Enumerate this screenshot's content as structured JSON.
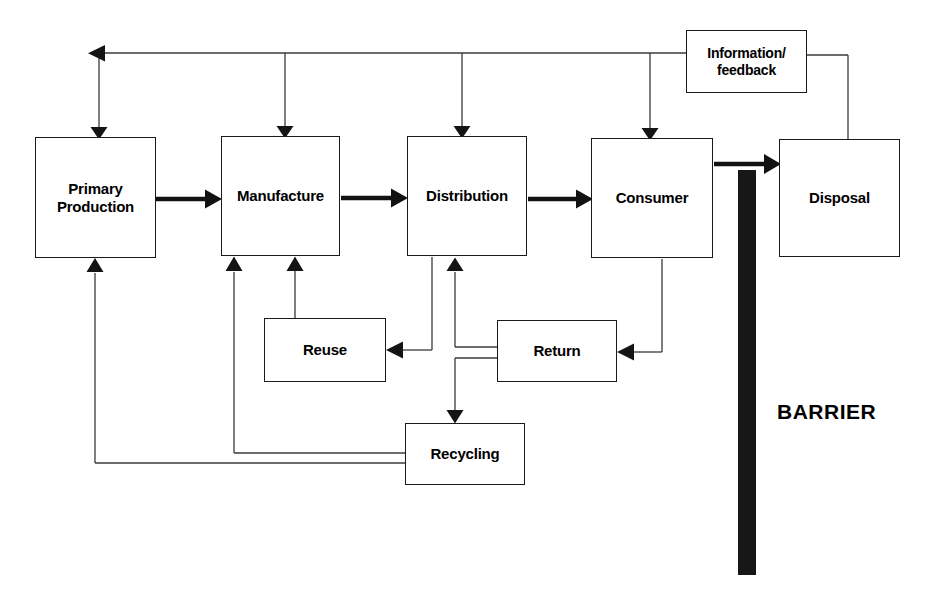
{
  "diagram": {
    "stroke_color": "#1a1a1a",
    "fill_color": "#ffffff",
    "barrier_color": "#171717",
    "nodes": [
      {
        "id": "primary_production",
        "label": "Primary\nProduction",
        "x": 35,
        "y": 137,
        "w": 121,
        "h": 121,
        "font_size": 15
      },
      {
        "id": "manufacture",
        "label": "Manufacture",
        "x": 221,
        "y": 136,
        "w": 119,
        "h": 120,
        "font_size": 15
      },
      {
        "id": "distribution",
        "label": "Distribution",
        "x": 407,
        "y": 136,
        "w": 120,
        "h": 120,
        "font_size": 15
      },
      {
        "id": "consumer",
        "label": "Consumer",
        "x": 591,
        "y": 138,
        "w": 122,
        "h": 120,
        "font_size": 15
      },
      {
        "id": "disposal",
        "label": "Disposal",
        "x": 779,
        "y": 139,
        "w": 121,
        "h": 118,
        "font_size": 15
      },
      {
        "id": "information_feedback",
        "label": "Information/\nfeedback",
        "x": 686,
        "y": 30,
        "w": 121,
        "h": 63,
        "font_size": 14
      },
      {
        "id": "reuse",
        "label": "Reuse",
        "x": 264,
        "y": 318,
        "w": 122,
        "h": 64,
        "font_size": 15
      },
      {
        "id": "return",
        "label": "Return",
        "x": 497,
        "y": 320,
        "w": 120,
        "h": 62,
        "font_size": 15
      },
      {
        "id": "recycling",
        "label": "Recycling",
        "x": 405,
        "y": 423,
        "w": 120,
        "h": 62,
        "font_size": 15
      }
    ],
    "barrier": {
      "label": "BARRIER",
      "bar_x": 738,
      "bar_y": 170,
      "bar_w": 18,
      "bar_h": 405,
      "text_x": 777,
      "text_y": 400,
      "font_size": 21
    },
    "edges": [
      {
        "id": "primary-to-manufacture",
        "from": "primary_production",
        "to": "manufacture",
        "style": "thick"
      },
      {
        "id": "manufacture-to-distribution",
        "from": "manufacture",
        "to": "distribution",
        "style": "thick"
      },
      {
        "id": "distribution-to-consumer",
        "from": "distribution",
        "to": "consumer",
        "style": "thick"
      },
      {
        "id": "consumer-to-disposal",
        "from": "consumer",
        "to": "disposal",
        "style": "thick"
      },
      {
        "id": "feedback-bus",
        "from": "information_feedback",
        "to": "primary_production",
        "style": "thin"
      },
      {
        "id": "feedback-to-manufacture",
        "from": "information_feedback",
        "to": "manufacture",
        "style": "thin"
      },
      {
        "id": "feedback-to-distribution",
        "from": "information_feedback",
        "to": "distribution",
        "style": "thin"
      },
      {
        "id": "feedback-to-consumer",
        "from": "information_feedback",
        "to": "consumer",
        "style": "thin"
      },
      {
        "id": "disposal-to-feedback",
        "from": "disposal",
        "to": "information_feedback",
        "style": "thin"
      },
      {
        "id": "consumer-to-return",
        "from": "consumer",
        "to": "return",
        "style": "thin"
      },
      {
        "id": "return-to-reuse",
        "from": "return",
        "to": "reuse",
        "style": "thin"
      },
      {
        "id": "return-to-recycling",
        "from": "return",
        "to": "recycling",
        "style": "thin"
      },
      {
        "id": "distribution-to-reuse",
        "from": "distribution",
        "to": "reuse",
        "style": "thin"
      },
      {
        "id": "return-to-distribution",
        "from": "return",
        "to": "distribution",
        "style": "thin"
      },
      {
        "id": "reuse-to-manufacture",
        "from": "reuse",
        "to": "manufacture",
        "style": "thin"
      },
      {
        "id": "recycling-to-manufacture",
        "from": "recycling",
        "to": "manufacture",
        "style": "thin"
      },
      {
        "id": "recycling-to-primary",
        "from": "recycling",
        "to": "primary_production",
        "style": "thin"
      }
    ]
  }
}
